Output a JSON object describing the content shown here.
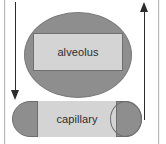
{
  "figure": {
    "width": 166,
    "height": 144,
    "background": "#ffffff"
  },
  "shapes": {
    "alveolus": {
      "label": "alveolus",
      "fill": "#8e8e8e",
      "inner_fill": "#d4d4d4",
      "stroke": "#6e6e6e"
    },
    "capillary": {
      "label": "capillary",
      "fill": "#8e8e8e",
      "inner_fill": "#d4d4d4",
      "stroke": "#6e6e6e"
    }
  },
  "arrows": {
    "inflow": {
      "name": "downward arrow",
      "direction": "down",
      "color": "#2b2b2b"
    },
    "outflow": {
      "name": "upward arrow",
      "direction": "up",
      "color": "#2b2b2b"
    }
  },
  "frame": {
    "rule_color": "#b9b9b9"
  }
}
